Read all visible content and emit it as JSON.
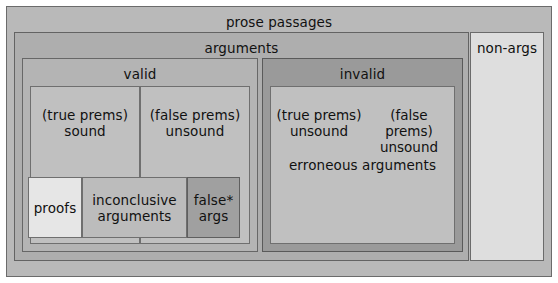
{
  "diagram": {
    "title": "prose passages",
    "levels": {
      "prose_passages": "prose passages",
      "arguments": "arguments",
      "non_args": "non-args",
      "valid": "valid",
      "invalid": "invalid",
      "true_prems_sound": "(true prems)\nsound",
      "false_prems_unsound": "(false prems)\nunsound",
      "erroneous_true_prems_unsound": "(true prems)\nunsound",
      "erroneous_false_prems_unsound": "(false prems)\nunsound",
      "erroneous_arguments": "erroneous arguments",
      "proofs": "proofs",
      "inconclusive_arguments": "inconclusive\narguments",
      "false_args": "false*\nargs"
    },
    "colors": {
      "prose_passages_fill": "#b9b9b9",
      "arguments_fill": "#aeaeae",
      "non_args_fill": "#dedede",
      "valid_fill": "#b4b4b4",
      "invalid_fill": "#9a9a9a",
      "premise_cell_fill": "#c0c0c0",
      "proofs_fill": "#e6e6e6",
      "inconclusive_fill": "#bcbcbc",
      "false_args_fill": "#a0a0a0",
      "border": "#5e5e5e",
      "text": "#111111"
    }
  }
}
